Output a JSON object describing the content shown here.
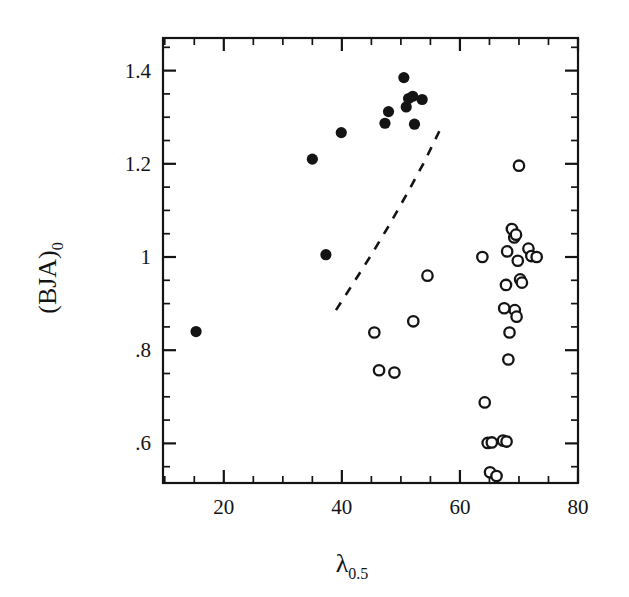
{
  "chart_data": {
    "type": "scatter",
    "title": "",
    "xlabel": "λ",
    "xlabel_sub": "0.5",
    "ylabel": "(BJA)",
    "ylabel_sub": "0",
    "xlim": [
      9.7,
      80
    ],
    "ylim": [
      0.515,
      1.47
    ],
    "grid": false,
    "legend": "none",
    "x_ticks_major": [
      20,
      40,
      60,
      80
    ],
    "x_tick_labels": [
      "20",
      "40",
      "60",
      "80"
    ],
    "x_ticks_minor": [
      10,
      15,
      25,
      30,
      35,
      45,
      50,
      55,
      65,
      70,
      75
    ],
    "y_ticks_major": [
      1.4,
      1.2,
      1.0,
      0.8,
      0.6
    ],
    "y_tick_labels": [
      "1.4",
      "1.2",
      "1",
      ".8",
      ".6"
    ],
    "y_ticks_minor": [
      0.55,
      0.65,
      0.7,
      0.75,
      0.85,
      0.9,
      0.95,
      1.05,
      1.1,
      1.15,
      1.25,
      1.3,
      1.35,
      1.45
    ],
    "series": [
      {
        "name": "filled-circles",
        "marker": "filled-circle",
        "color": "#141414",
        "points": [
          {
            "x": 15.3,
            "y": 0.84
          },
          {
            "x": 35.0,
            "y": 1.21
          },
          {
            "x": 37.3,
            "y": 1.005
          },
          {
            "x": 39.9,
            "y": 1.267
          },
          {
            "x": 47.3,
            "y": 1.287
          },
          {
            "x": 47.9,
            "y": 1.312
          },
          {
            "x": 50.5,
            "y": 1.385
          },
          {
            "x": 50.9,
            "y": 1.322
          },
          {
            "x": 51.3,
            "y": 1.34
          },
          {
            "x": 52.0,
            "y": 1.345
          },
          {
            "x": 52.3,
            "y": 1.285
          },
          {
            "x": 53.6,
            "y": 1.338
          }
        ]
      },
      {
        "name": "open-circles",
        "marker": "open-circle",
        "color": "#141414",
        "points": [
          {
            "x": 45.5,
            "y": 0.838
          },
          {
            "x": 46.3,
            "y": 0.757
          },
          {
            "x": 48.9,
            "y": 0.752
          },
          {
            "x": 52.1,
            "y": 0.862
          },
          {
            "x": 54.5,
            "y": 0.96
          },
          {
            "x": 63.8,
            "y": 1.0
          },
          {
            "x": 64.2,
            "y": 0.688
          },
          {
            "x": 64.7,
            "y": 0.601
          },
          {
            "x": 65.4,
            "y": 0.602
          },
          {
            "x": 65.1,
            "y": 0.538
          },
          {
            "x": 66.2,
            "y": 0.53
          },
          {
            "x": 67.3,
            "y": 0.606
          },
          {
            "x": 67.9,
            "y": 0.604
          },
          {
            "x": 67.5,
            "y": 0.89
          },
          {
            "x": 67.8,
            "y": 0.94
          },
          {
            "x": 68.0,
            "y": 1.012
          },
          {
            "x": 68.4,
            "y": 0.838
          },
          {
            "x": 68.2,
            "y": 0.78
          },
          {
            "x": 68.8,
            "y": 1.06
          },
          {
            "x": 69.2,
            "y": 1.042
          },
          {
            "x": 69.5,
            "y": 1.048
          },
          {
            "x": 69.3,
            "y": 0.886
          },
          {
            "x": 69.6,
            "y": 0.872
          },
          {
            "x": 69.8,
            "y": 0.992
          },
          {
            "x": 70.2,
            "y": 0.952
          },
          {
            "x": 70.5,
            "y": 0.945
          },
          {
            "x": 70.0,
            "y": 1.196
          },
          {
            "x": 71.6,
            "y": 1.018
          },
          {
            "x": 72.1,
            "y": 1.002
          },
          {
            "x": 73.0,
            "y": 1.0
          }
        ]
      }
    ],
    "annotations": [
      {
        "name": "dashed-boundary-curve",
        "style": "dashed",
        "points": [
          {
            "x": 39.0,
            "y": 0.886
          },
          {
            "x": 42.0,
            "y": 0.945
          },
          {
            "x": 45.0,
            "y": 1.005
          },
          {
            "x": 48.0,
            "y": 1.068
          },
          {
            "x": 51.0,
            "y": 1.135
          },
          {
            "x": 54.0,
            "y": 1.205
          },
          {
            "x": 56.5,
            "y": 1.27
          }
        ]
      }
    ]
  }
}
